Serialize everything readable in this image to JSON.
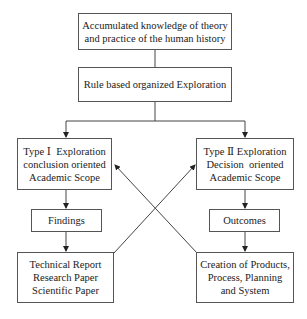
{
  "diagram": {
    "nodes": {
      "knowledge": {
        "lines": [
          "Accumulated knowledge of theory",
          "and practice of the human history"
        ]
      },
      "exploration": {
        "lines": [
          "Rule based organized Exploration"
        ]
      },
      "type1": {
        "lines": [
          "Type Ⅰ  Exploration",
          "conclusion oriented",
          "Academic Scope"
        ]
      },
      "type2": {
        "lines": [
          "Type Ⅱ Exploration",
          "Decision  oriented",
          "Academic Scope"
        ]
      },
      "findings": {
        "lines": [
          "Findings"
        ]
      },
      "outcomes": {
        "lines": [
          "Outcomes"
        ]
      },
      "reports": {
        "lines": [
          "Technical Report",
          "Research Paper",
          "Scientific Paper"
        ]
      },
      "creation": {
        "lines": [
          "Creation of Products,",
          "Process, Planning",
          "and System"
        ]
      }
    },
    "edges": [
      {
        "from": "knowledge",
        "to": "exploration"
      },
      {
        "from": "exploration",
        "to": "type1"
      },
      {
        "from": "exploration",
        "to": "type2"
      },
      {
        "from": "type1",
        "to": "findings"
      },
      {
        "from": "findings",
        "to": "reports"
      },
      {
        "from": "type2",
        "to": "outcomes"
      },
      {
        "from": "outcomes",
        "to": "creation"
      },
      {
        "from": "reports",
        "to": "type2"
      },
      {
        "from": "creation",
        "to": "type1"
      }
    ]
  }
}
